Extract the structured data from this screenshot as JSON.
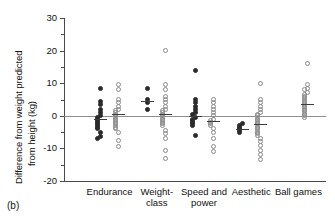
{
  "figure": {
    "panel_label": "(b)"
  },
  "chart_data": {
    "type": "scatter",
    "title": "",
    "xlabel": "",
    "ylabel": "Difference from weight predicted from height (kg)",
    "ylabel_line1": "Difference from weight predicted",
    "ylabel_line2": "from height (kg)",
    "ylim": [
      -20,
      30
    ],
    "yticks": [
      30,
      20,
      10,
      0,
      -10,
      -20
    ],
    "ytick_labels": [
      "30",
      "20",
      "10",
      "0",
      "-10",
      "-20"
    ],
    "yticks_minor": [
      25,
      15,
      5,
      -5,
      -15
    ],
    "grid": false,
    "legend": "none",
    "reference_line": 0,
    "categories": [
      "Endurance",
      "Weight-class",
      "Speed and power",
      "Aesthetic",
      "Ball games"
    ],
    "category_labels": [
      [
        "Endurance"
      ],
      [
        "Weight-",
        "class"
      ],
      [
        "Speed and",
        "power"
      ],
      [
        "Aesthetic"
      ],
      [
        "Ball games"
      ]
    ],
    "marker_styles": {
      "filled": "solid circle",
      "open": "open circle"
    },
    "series": [
      {
        "name": "filled",
        "marker": "filled",
        "groups": [
          {
            "category": "Endurance",
            "mean": -1.0,
            "values": [
              8.5,
              4.5,
              3.5,
              2.0,
              1.0,
              0.0,
              -0.5,
              -1.0,
              -1.5,
              -2.0,
              -2.5,
              -3.0,
              -3.5,
              -4.0,
              -5.0,
              -6.5,
              -7.0
            ]
          },
          {
            "category": "Weight-class",
            "mean": 4.5,
            "values": [
              8.5,
              5.0,
              4.0,
              2.0
            ]
          },
          {
            "category": "Speed and power",
            "mean": 0.0,
            "values": [
              14.0,
              5.0,
              4.0,
              3.0,
              2.0,
              1.0,
              0.5,
              -0.5,
              -1.0,
              -1.5,
              -2.0,
              -2.5,
              -3.0,
              -6.0
            ]
          },
          {
            "category": "Aesthetic",
            "mean": -4.0,
            "values": [
              -2.5,
              -3.0,
              -3.5,
              -4.0,
              -4.5,
              -5.0
            ]
          }
        ]
      },
      {
        "name": "open",
        "marker": "open",
        "groups": [
          {
            "category": "Endurance",
            "mean": 0.5,
            "values": [
              9.5,
              8.0,
              5.0,
              4.0,
              3.0,
              2.0,
              1.5,
              1.0,
              0.5,
              0.0,
              -0.5,
              -1.0,
              -1.5,
              -2.0,
              -2.5,
              -3.0,
              -3.5,
              -4.0,
              -5.0,
              -7.5,
              -9.5
            ]
          },
          {
            "category": "Weight-class",
            "mean": 0.5,
            "values": [
              20.0,
              9.5,
              8.0,
              6.0,
              5.0,
              4.0,
              3.0,
              2.0,
              1.5,
              1.0,
              0.5,
              0.0,
              -0.5,
              -1.0,
              -1.5,
              -2.0,
              -2.5,
              -3.0,
              -4.5,
              -5.5,
              -7.0,
              -10.5,
              -13.0
            ]
          },
          {
            "category": "Speed and power",
            "mean": -1.5,
            "values": [
              5.0,
              4.0,
              3.0,
              2.0,
              1.0,
              0.0,
              -1.0,
              -1.5,
              -2.0,
              -2.5,
              -3.0,
              -4.0,
              -5.0,
              -7.0,
              -9.5,
              -11.0
            ]
          },
          {
            "category": "Aesthetic",
            "mean": -2.5,
            "values": [
              10.0,
              5.0,
              4.0,
              3.0,
              2.0,
              1.0,
              0.5,
              0.0,
              -0.5,
              -1.0,
              -1.5,
              -2.0,
              -2.5,
              -3.0,
              -3.5,
              -4.0,
              -4.5,
              -5.0,
              -5.5,
              -6.0,
              -7.0,
              -8.0,
              -9.0,
              -10.5,
              -12.0,
              -13.5
            ]
          },
          {
            "category": "Ball games",
            "mean": 3.5,
            "values": [
              16.0,
              9.5,
              8.5,
              8.0,
              7.0,
              6.5,
              6.0,
              5.5,
              5.0,
              4.5,
              4.0,
              3.5,
              3.0,
              2.5,
              2.0,
              1.5,
              1.0,
              0.5,
              0.0,
              -0.5
            ]
          }
        ]
      }
    ]
  }
}
